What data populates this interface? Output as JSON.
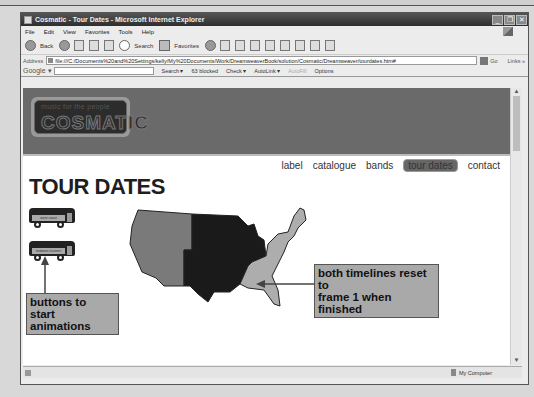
{
  "browser": {
    "title": "Cosmatic - Tour Dates - Microsoft Internet Explorer",
    "window_controls": {
      "minimize": "_",
      "restore": "❐",
      "close": "✕"
    },
    "menu": [
      "File",
      "Edit",
      "View",
      "Favorites",
      "Tools",
      "Help"
    ],
    "toolbar": {
      "back": "Back",
      "search": "Search",
      "favorites": "Favorites"
    },
    "address": {
      "label": "Address",
      "value": "file:///C:/Documents%20and%20Settings/kelly/My%20Documents/Work/DreamweaverBook/solution/Cosmatic/Dreamweaver/tourdates.htm#",
      "go": "Go",
      "links": "Links »"
    },
    "google_bar": {
      "logo": "Google ▾",
      "search": "Search ▾",
      "blocked": "63 blocked",
      "check": "Check ▾",
      "autolink": "AutoLink ▾",
      "autofill": "AutoFill",
      "options": "Options"
    },
    "status": {
      "zone": "My Computer"
    }
  },
  "site": {
    "logo": {
      "tagline": "music for the people",
      "name": "COSMATIC"
    },
    "nav": [
      {
        "label": "label",
        "active": false
      },
      {
        "label": "catalogue",
        "active": false
      },
      {
        "label": "bands",
        "active": false
      },
      {
        "label": "tour dates",
        "active": true
      },
      {
        "label": "contact",
        "active": false
      }
    ],
    "page_title": "TOUR DATES",
    "buttons": [
      {
        "label": "west coast"
      },
      {
        "label": "midwest eastern"
      }
    ],
    "map": {
      "regions": [
        {
          "name": "west",
          "color": "#7a7a7a"
        },
        {
          "name": "central",
          "color": "#1a1a1a"
        },
        {
          "name": "east",
          "color": "#adadad"
        }
      ]
    }
  },
  "annotations": {
    "buttons_note": [
      "buttons to",
      "start animations"
    ],
    "timeline_note": [
      "both timelines reset to",
      "frame 1 when finished"
    ]
  }
}
